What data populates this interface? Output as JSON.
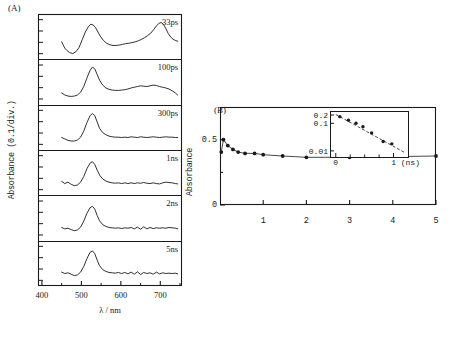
{
  "figure": {
    "panel_a": {
      "label": "(A)",
      "ylabel": "Absorbance (0.1/div.)",
      "xlabel": "λ / nm",
      "xticks": [
        400,
        500,
        600,
        700
      ],
      "xlim": [
        390,
        755
      ],
      "trace_labels": [
        "33ps",
        "100ps",
        "300ps",
        "1ns",
        "2ns",
        "5ns"
      ]
    },
    "panel_b": {
      "label": "(B)",
      "ylabel": "Absorbance",
      "yticks": [
        "0.5",
        "0"
      ],
      "xticks": [
        "1",
        "2",
        "3",
        "4",
        "5"
      ],
      "inset": {
        "yticks": [
          "0.2",
          "0.1",
          "0.01"
        ],
        "xticks": [
          "0",
          "1 (ns)"
        ]
      }
    }
  },
  "chart_data": [
    {
      "type": "line",
      "title": "(A) Transient absorption spectra",
      "xlabel": "λ / nm",
      "ylabel": "Absorbance (0.1/div.)",
      "xlim": [
        390,
        755
      ],
      "xticks": [
        400,
        500,
        600,
        700
      ],
      "grid": false,
      "legend_position": "inside-right",
      "series": [
        {
          "name": "33ps",
          "x": [
            450,
            458,
            463,
            470,
            478,
            486,
            494,
            502,
            510,
            518,
            524,
            530,
            536,
            542,
            548,
            556,
            564,
            572,
            580,
            588,
            596,
            604,
            612,
            620,
            628,
            636,
            644,
            652,
            660,
            668,
            676,
            684,
            690,
            696,
            702,
            708,
            714,
            720,
            726,
            732,
            738,
            744
          ],
          "y": [
            0.38,
            0.2,
            0.14,
            0.08,
            0.05,
            0.1,
            0.22,
            0.44,
            0.66,
            0.82,
            0.88,
            0.86,
            0.78,
            0.66,
            0.54,
            0.42,
            0.34,
            0.3,
            0.28,
            0.28,
            0.29,
            0.31,
            0.33,
            0.34,
            0.36,
            0.38,
            0.41,
            0.45,
            0.5,
            0.56,
            0.63,
            0.74,
            0.83,
            0.9,
            0.93,
            0.88,
            0.76,
            0.62,
            0.52,
            0.46,
            0.42,
            0.4
          ]
        },
        {
          "name": "100ps",
          "x": [
            450,
            458,
            466,
            474,
            482,
            490,
            498,
            506,
            514,
            522,
            528,
            534,
            540,
            546,
            554,
            562,
            570,
            578,
            586,
            594,
            602,
            610,
            618,
            626,
            634,
            642,
            650,
            658,
            666,
            674,
            682,
            690,
            698,
            706,
            714,
            722,
            730,
            738,
            744
          ],
          "y": [
            0.22,
            0.16,
            0.13,
            0.12,
            0.13,
            0.16,
            0.24,
            0.4,
            0.64,
            0.86,
            0.95,
            0.9,
            0.74,
            0.58,
            0.44,
            0.36,
            0.32,
            0.3,
            0.29,
            0.29,
            0.3,
            0.31,
            0.33,
            0.36,
            0.38,
            0.4,
            0.42,
            0.41,
            0.4,
            0.42,
            0.44,
            0.43,
            0.4,
            0.38,
            0.36,
            0.33,
            0.28,
            0.22,
            0.16
          ]
        },
        {
          "name": "300ps",
          "x": [
            450,
            458,
            466,
            474,
            482,
            490,
            498,
            506,
            514,
            522,
            528,
            534,
            540,
            546,
            554,
            562,
            570,
            578,
            586,
            594,
            602,
            610,
            618,
            626,
            634,
            642,
            650,
            658,
            666,
            674,
            682,
            690,
            698,
            706,
            714,
            722,
            730,
            738,
            744
          ],
          "y": [
            0.24,
            0.2,
            0.16,
            0.14,
            0.14,
            0.17,
            0.25,
            0.42,
            0.66,
            0.86,
            0.92,
            0.86,
            0.68,
            0.5,
            0.38,
            0.32,
            0.28,
            0.26,
            0.25,
            0.25,
            0.24,
            0.25,
            0.24,
            0.26,
            0.25,
            0.24,
            0.26,
            0.25,
            0.24,
            0.25,
            0.26,
            0.25,
            0.24,
            0.25,
            0.26,
            0.25,
            0.25,
            0.24,
            0.24
          ]
        },
        {
          "name": "1ns",
          "x": [
            450,
            458,
            466,
            474,
            482,
            490,
            498,
            506,
            514,
            522,
            528,
            534,
            540,
            546,
            554,
            562,
            570,
            578,
            586,
            594,
            602,
            610,
            618,
            626,
            634,
            642,
            650,
            658,
            666,
            674,
            682,
            690,
            698,
            706,
            714,
            722,
            730,
            738,
            744
          ],
          "y": [
            0.28,
            0.22,
            0.26,
            0.2,
            0.16,
            0.18,
            0.26,
            0.42,
            0.64,
            0.8,
            0.84,
            0.76,
            0.6,
            0.46,
            0.35,
            0.29,
            0.26,
            0.24,
            0.23,
            0.24,
            0.22,
            0.24,
            0.22,
            0.24,
            0.22,
            0.24,
            0.23,
            0.25,
            0.23,
            0.22,
            0.24,
            0.22,
            0.21,
            0.24,
            0.26,
            0.25,
            0.24,
            0.22,
            0.21
          ]
        },
        {
          "name": "2ns",
          "x": [
            450,
            458,
            466,
            474,
            482,
            490,
            498,
            506,
            514,
            522,
            528,
            534,
            540,
            546,
            554,
            562,
            570,
            578,
            586,
            594,
            602,
            610,
            618,
            626,
            634,
            642,
            650,
            658,
            666,
            674,
            682,
            690,
            698,
            706,
            714,
            722,
            730,
            738,
            744
          ],
          "y": [
            0.26,
            0.22,
            0.24,
            0.2,
            0.17,
            0.19,
            0.27,
            0.44,
            0.66,
            0.82,
            0.86,
            0.78,
            0.6,
            0.45,
            0.34,
            0.29,
            0.26,
            0.25,
            0.24,
            0.25,
            0.23,
            0.25,
            0.24,
            0.26,
            0.22,
            0.27,
            0.21,
            0.28,
            0.22,
            0.26,
            0.23,
            0.25,
            0.24,
            0.25,
            0.24,
            0.26,
            0.25,
            0.24,
            0.22
          ]
        },
        {
          "name": "5ns",
          "x": [
            450,
            458,
            466,
            474,
            482,
            490,
            498,
            506,
            514,
            522,
            528,
            534,
            540,
            546,
            554,
            562,
            570,
            578,
            586,
            594,
            602,
            610,
            618,
            626,
            634,
            642,
            650,
            658,
            666,
            674,
            682,
            690,
            698,
            706,
            714,
            722,
            730,
            738,
            744
          ],
          "y": [
            0.28,
            0.24,
            0.26,
            0.22,
            0.18,
            0.2,
            0.28,
            0.44,
            0.66,
            0.84,
            0.88,
            0.8,
            0.62,
            0.46,
            0.35,
            0.3,
            0.27,
            0.26,
            0.25,
            0.27,
            0.24,
            0.27,
            0.23,
            0.28,
            0.22,
            0.29,
            0.21,
            0.27,
            0.24,
            0.26,
            0.22,
            0.28,
            0.23,
            0.26,
            0.24,
            0.25,
            0.24,
            0.25,
            0.23
          ]
        }
      ]
    },
    {
      "type": "scatter",
      "title": "(B) Absorbance decay",
      "xlabel": "",
      "ylabel": "Absorbance",
      "xlim": [
        0,
        5
      ],
      "ylim": [
        0,
        0.75
      ],
      "xticks": [
        1,
        2,
        3,
        4,
        5
      ],
      "yticks": [
        0,
        0.5
      ],
      "grid": false,
      "x": [
        0.03,
        0.08,
        0.18,
        0.3,
        0.42,
        0.58,
        0.8,
        1.0,
        1.45,
        2.0,
        3.0,
        5.0
      ],
      "y": [
        0.405,
        0.5,
        0.455,
        0.425,
        0.405,
        0.395,
        0.395,
        0.385,
        0.375,
        0.365,
        0.365,
        0.375
      ],
      "connected": true
    },
    {
      "type": "scatter",
      "title": "(B) inset - semilog decay",
      "xlabel": "1 (ns)",
      "ylabel": "",
      "yscale": "log",
      "xlim": [
        -0.1,
        1.25
      ],
      "ylim": [
        0.006,
        0.28
      ],
      "xticks": [
        0,
        1
      ],
      "yticks": [
        0.2,
        0.1,
        0.01
      ],
      "grid": false,
      "x": [
        0.07,
        0.22,
        0.35,
        0.47,
        0.62,
        0.82,
        0.97
      ],
      "y": [
        0.175,
        0.13,
        0.1,
        0.075,
        0.045,
        0.022,
        0.018
      ],
      "fit_line": {
        "x": [
          0.0,
          1.18
        ],
        "y": [
          0.21,
          0.009
        ]
      }
    }
  ]
}
